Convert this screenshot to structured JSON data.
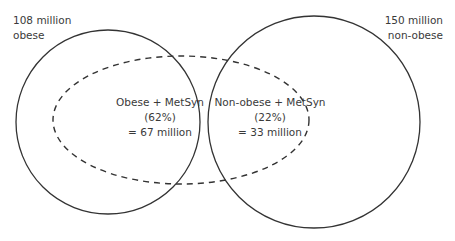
{
  "diagram": {
    "type": "venn",
    "sets": [
      {
        "id": "obese",
        "label_line1": "108 million",
        "label_line2": "obese",
        "value_millions": 108
      },
      {
        "id": "non_obese",
        "label_line1": "150 million",
        "label_line2": "non-obese",
        "value_millions": 150
      }
    ],
    "overlay": {
      "id": "metsyn",
      "style": "dashed-ellipse"
    },
    "regions": [
      {
        "id": "obese_metsyn",
        "line1": "Obese + MetSyn",
        "line2": "(62%)",
        "line3": "= 67 million",
        "percent": 62,
        "value_millions": 67
      },
      {
        "id": "nonobese_metsyn",
        "line1": "Non-obese + MetSyn",
        "line2": "(22%)",
        "line3": "= 33 million",
        "percent": 22,
        "value_millions": 33
      }
    ],
    "colors": {
      "stroke": "#333333",
      "text": "#3a3a3a",
      "background": "#ffffff"
    }
  }
}
